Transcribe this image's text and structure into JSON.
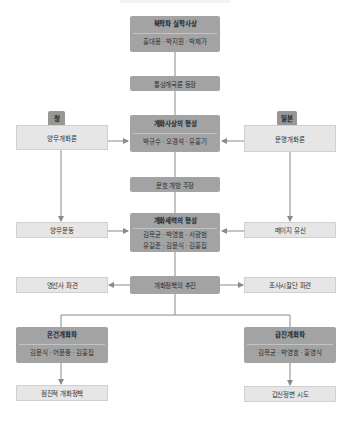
{
  "diagram": {
    "colors": {
      "dark_box": "#a3a3a3",
      "light_box": "#e6e6e6",
      "tab": "#979797",
      "connector": "#8a8a8a"
    },
    "nodes": {
      "bukhak": {
        "title": "북학파 실학사상",
        "names": "홍대용 · 박지원 · 박제가"
      },
      "tongsang": {
        "label": "통상개국론 등장"
      },
      "gaehwa_sasang": {
        "title": "개화사상의 형성",
        "names": "박규수 · 오경석 · 유홍기"
      },
      "qing": {
        "tab": "청",
        "label": "양무개화론"
      },
      "japan": {
        "tab": "일본",
        "label": "문명개화론"
      },
      "munho": {
        "label": "문호 개방 주장"
      },
      "gaehwa_seryeok": {
        "title": "개화세력의 형성",
        "names_line1": "김옥균 · 박영효 · 서광범",
        "names_line2": "유길준 · 김윤식 · 김홍집"
      },
      "yangmu_undong": {
        "label": "양무운동"
      },
      "meiji": {
        "label": "메이지 유신"
      },
      "policy": {
        "label": "개화정책의 추진"
      },
      "yeongseonsa": {
        "label": "영선사 파견"
      },
      "josa": {
        "label": "조사시찰단 파견"
      },
      "ongeon": {
        "title": "온건개화파",
        "names": "김윤식 · 어윤중 · 김홍집"
      },
      "geupjin": {
        "title": "급진개화파",
        "names": "김옥균 · 박영효 · 홍영식"
      },
      "jeomjin": {
        "label": "점진적 개화정책"
      },
      "gapsin": {
        "label": "갑신정변 시도"
      }
    }
  }
}
